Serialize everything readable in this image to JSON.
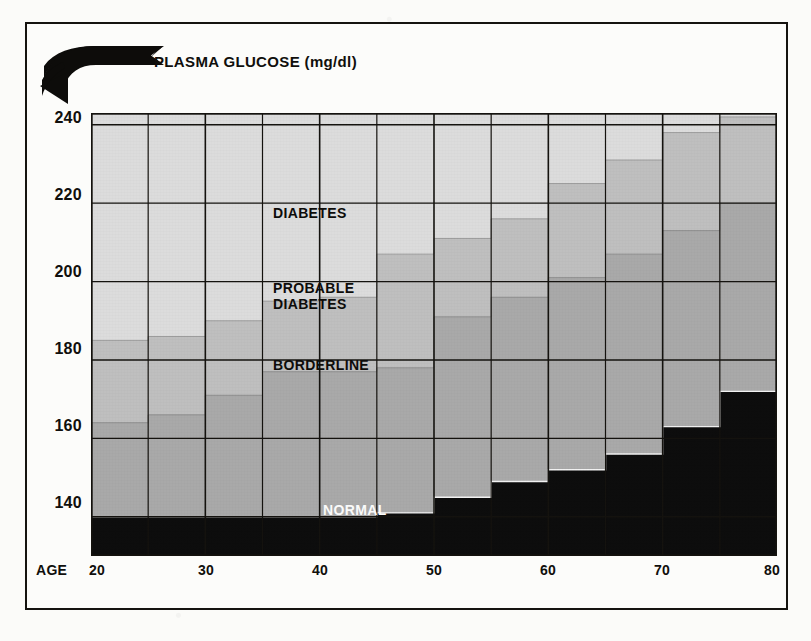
{
  "figure": {
    "title": "PLASMA GLUCOSE (mg/dl)",
    "arrow_icon": "curved-arrow-down-left-icon"
  },
  "axes": {
    "x_axis_name": "AGE",
    "x_ticks": [
      "20",
      "30",
      "40",
      "50",
      "60",
      "70",
      "80"
    ],
    "y_ticks": [
      "240",
      "220",
      "200",
      "180",
      "160",
      "140"
    ]
  },
  "bands": {
    "diabetes": "DIABETES",
    "probable_diabetes": "PROBABLE\nDIABETES",
    "borderline": "BORDERLINE",
    "normal": "NORMAL"
  },
  "colors": {
    "normal": "#0d0d0d",
    "borderline": "#a9a9a9",
    "probable_diabetes": "#bfbfbf",
    "diabetes": "#dcdcdc",
    "gridline": "#15130f",
    "step_edge": "#8e8e8e",
    "text": "#100f0c"
  },
  "chart_data": {
    "type": "area",
    "subtype": "stacked-step-bands",
    "title": "PLASMA GLUCOSE (mg/dl)",
    "xlabel": "AGE",
    "ylabel": "PLASMA GLUCOSE (mg/dl)",
    "xlim": [
      20,
      80
    ],
    "ylim": [
      130,
      245
    ],
    "ylim_visible": [
      130,
      243
    ],
    "y_gridlines": [
      140,
      160,
      180,
      200,
      220,
      240
    ],
    "x_gridlines": [
      20,
      30,
      40,
      50,
      60,
      70,
      80
    ],
    "grid": true,
    "legend": "inline-band-labels",
    "bin_width_years": 5,
    "bin_starts": [
      20,
      25,
      30,
      35,
      40,
      45,
      50,
      55,
      60,
      65,
      70,
      75
    ],
    "bin_labels": [
      "20-24",
      "25-29",
      "30-34",
      "35-39",
      "40-44",
      "45-49",
      "50-54",
      "55-59",
      "60-64",
      "65-69",
      "70-74",
      "75-80"
    ],
    "series": [
      {
        "name": "NORMAL",
        "description": "upper boundary of NORMAL band (mg/dl)",
        "color": "#0d0d0d",
        "values": [
          140,
          140,
          140,
          140,
          140,
          141,
          145,
          149,
          152,
          156,
          163,
          172
        ]
      },
      {
        "name": "BORDERLINE",
        "description": "upper boundary of BORDERLINE band (mg/dl)",
        "color": "#a9a9a9",
        "values": [
          164,
          166,
          171,
          177,
          177,
          178,
          191,
          196,
          201,
          207,
          213,
          220
        ]
      },
      {
        "name": "PROBABLE DIABETES",
        "description": "upper boundary of PROBABLE DIABETES band (mg/dl)",
        "color": "#bfbfbf",
        "values": [
          185,
          186,
          190,
          195,
          196,
          207,
          211,
          216,
          225,
          231,
          238,
          242
        ]
      },
      {
        "name": "DIABETES",
        "description": "DIABETES band extends above PROBABLE DIABETES to top of plot",
        "color": "#dcdcdc",
        "values": [
          243,
          243,
          243,
          243,
          243,
          243,
          243,
          243,
          243,
          243,
          243,
          243
        ]
      }
    ],
    "annotations": [
      {
        "text": "DIABETES",
        "x_approx": 31,
        "y_approx": 218
      },
      {
        "text": "PROBABLE DIABETES",
        "x_approx": 31,
        "y_approx": 199
      },
      {
        "text": "BORDERLINE",
        "x_approx": 31,
        "y_approx": 179
      },
      {
        "text": "NORMAL",
        "x_approx": 40,
        "y_approx": 137
      }
    ]
  }
}
